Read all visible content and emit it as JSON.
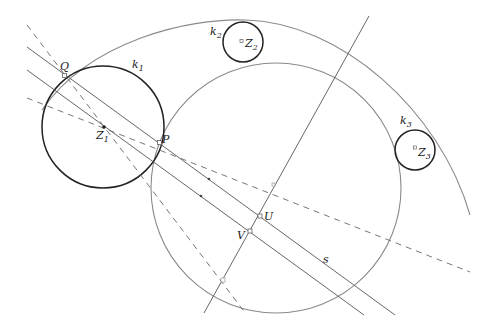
{
  "diagram": {
    "type": "geometric-construction",
    "colors": {
      "thin_line": "#777777",
      "thick_circle": "#222222",
      "dashed": "#777777",
      "label": "#222222"
    },
    "circles": {
      "k1": {
        "label": "k",
        "sub": "1",
        "center_label": "Z",
        "center_sub": "1"
      },
      "k2": {
        "label": "k",
        "sub": "2",
        "center_label": "Z",
        "center_sub": "2"
      },
      "k3": {
        "label": "k",
        "sub": "3",
        "center_label": "Z",
        "center_sub": "3"
      }
    },
    "points": {
      "Q": "Q",
      "P": "P",
      "U": "U",
      "V": "V"
    },
    "lines": {
      "s": "s"
    }
  }
}
